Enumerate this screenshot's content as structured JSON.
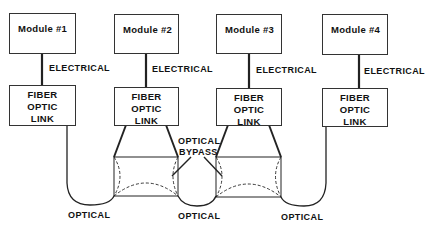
{
  "diagram": {
    "modules": [
      {
        "label": "Module #1"
      },
      {
        "label": "Module #2"
      },
      {
        "label": "Module #3"
      },
      {
        "label": "Module #4"
      }
    ],
    "link_lines": [
      "FIBER",
      "OPTIC",
      "LINK"
    ],
    "connection_label": "ELECTRICAL",
    "optical_label": "OPTICAL",
    "bypass_label_line1": "OPTICAL",
    "bypass_label_line2": "BYPASS"
  }
}
